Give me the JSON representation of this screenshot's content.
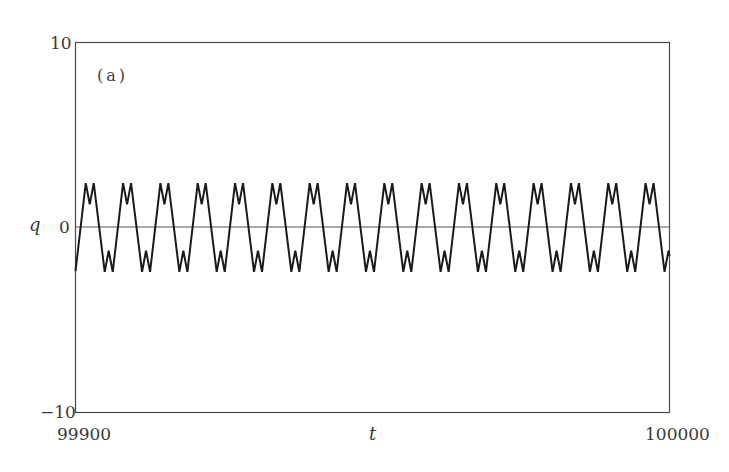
{
  "chart_data": {
    "type": "line",
    "title": "",
    "panel_label": "(a)",
    "xlabel": "t",
    "ylabel": "q",
    "xlim": [
      99900,
      100000
    ],
    "ylim": [
      -10,
      10
    ],
    "x_ticks": [
      "99900",
      "100000"
    ],
    "y_ticks": [
      "10",
      "0",
      "-10"
    ],
    "grid": false,
    "legend": null,
    "reference_lines": [
      {
        "axis": "y",
        "value": 0
      }
    ],
    "series": [
      {
        "name": "q(t)",
        "description": "Periodic oscillation with period ~2π; double-hump (M-shaped) maxima and W-shaped minima",
        "period": 6.283,
        "amplitude_max": 2.4,
        "amplitude_min": -2.4,
        "notch_value": 1.25,
        "bump_value": -1.25,
        "cycle_template": [
          {
            "dt": 0.0,
            "q": 1.25
          },
          {
            "dt": 0.67,
            "q": 2.4
          },
          {
            "dt": 2.52,
            "q": -2.4
          },
          {
            "dt": 3.19,
            "q": -1.25
          },
          {
            "dt": 3.87,
            "q": -2.4
          },
          {
            "dt": 5.61,
            "q": 2.4
          }
        ],
        "first_notch_t": 99902.4,
        "num_cycles_visible": 16
      }
    ]
  },
  "colors": {
    "line": "#1a1a1a",
    "frame": "#4a4a4a",
    "zero_line": "#555555",
    "text": "#3a3a3a"
  }
}
